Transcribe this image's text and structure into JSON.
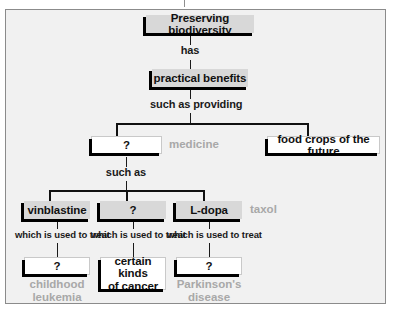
{
  "figure": {
    "type": "concept-map",
    "background_color": "#f1f1f1",
    "frame_color": "#8b8b8b",
    "box_fill_grey": "#d8d8d8",
    "box_fill_white": "#ffffff",
    "shadow_color": "#000000",
    "answer_text_color": "#a8a8a8",
    "text_color": "#111111"
  },
  "nodes": {
    "root": "Preserving biodiversity",
    "benefits": "practical benefits",
    "medicine_blank": "?",
    "food_crops": "food crops of the future",
    "vinblastine": "vinblastine",
    "drug_blank": "?",
    "ldopa": "L-dopa",
    "leukemia_blank": "?",
    "cancer": "certain kinds\nof cancer",
    "parkinsons_blank": "?"
  },
  "connectors": {
    "has": "has",
    "such_as_providing": "such as providing",
    "such_as": "such as",
    "treat_1": "which is used to treat",
    "treat_2": "which is used to treat",
    "treat_3": "which is used to treat"
  },
  "answers": {
    "medicine": "medicine",
    "taxol": "taxol",
    "childhood_leukemia": "childhood\nleukemia",
    "parkinsons_disease": "Parkinson's\ndisease"
  }
}
